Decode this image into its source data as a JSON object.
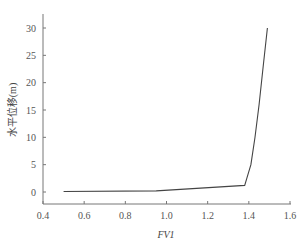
{
  "chart_data": {
    "type": "line",
    "title": "",
    "xlabel": "FV1",
    "ylabel": "水平位移(m)",
    "xlim": [
      0.4,
      1.6
    ],
    "ylim": [
      -2,
      32
    ],
    "xticks": [
      0.4,
      0.6,
      0.8,
      1.0,
      1.2,
      1.4,
      1.6
    ],
    "xtick_labels": [
      "0.4",
      "0.6",
      "0.8",
      "1.0",
      "1.2",
      "1.4",
      "1.6"
    ],
    "yticks": [
      0,
      5,
      10,
      15,
      20,
      25,
      30
    ],
    "ytick_labels": [
      "0",
      "5",
      "10",
      "15",
      "20",
      "25",
      "30"
    ],
    "grid": false,
    "legend": null,
    "series": [
      {
        "name": "水平位移",
        "color": "#444444",
        "x": [
          0.5,
          0.95,
          1.38,
          1.39,
          1.41,
          1.43,
          1.45,
          1.47,
          1.49
        ],
        "y": [
          0.1,
          0.2,
          1.2,
          2.5,
          5.0,
          10.0,
          16.0,
          23.0,
          30.0
        ]
      }
    ]
  }
}
